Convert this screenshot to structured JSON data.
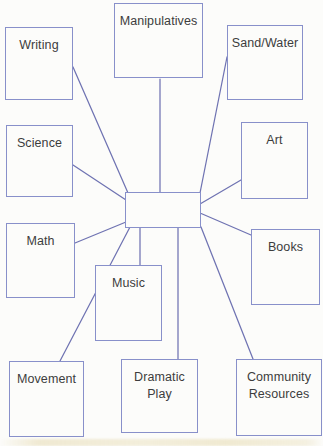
{
  "diagram": {
    "center": {
      "label": ""
    },
    "nodes": {
      "writing": {
        "label": "Writing"
      },
      "manipulatives": {
        "label": "Manipulatives"
      },
      "sand_water": {
        "label": "Sand/Water"
      },
      "science": {
        "label": "Science"
      },
      "art": {
        "label": "Art"
      },
      "math": {
        "label": "Math"
      },
      "books": {
        "label": "Books"
      },
      "music": {
        "label": "Music"
      },
      "movement": {
        "label": "Movement"
      },
      "dramatic_play": {
        "label": "Dramatic Play"
      },
      "community_resources": {
        "label": "Community Resources"
      }
    },
    "colors": {
      "background": "#fcfcfa",
      "box_border": "#8890ca",
      "line": "#6f73b2",
      "text": "#3d3d3d"
    }
  }
}
